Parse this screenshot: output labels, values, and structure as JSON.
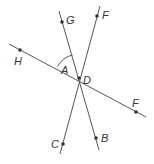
{
  "diagram": {
    "type": "intersecting-lines",
    "intersection_label": "D",
    "angle_label": "A",
    "points": [
      {
        "label": "G",
        "x": 62,
        "y": 22,
        "lx": 66,
        "ly": 24
      },
      {
        "label": "F",
        "x": 97,
        "y": 16,
        "lx": 102,
        "ly": 19
      },
      {
        "label": "H",
        "x": 20,
        "y": 50,
        "lx": 14,
        "ly": 65
      },
      {
        "label": "D",
        "x": 79,
        "y": 78,
        "lx": 83,
        "ly": 83
      },
      {
        "label": "F",
        "x": 136,
        "y": 112,
        "lx": 132,
        "ly": 107
      },
      {
        "label": "C",
        "x": 63,
        "y": 144,
        "lx": 51,
        "ly": 148
      },
      {
        "label": "B",
        "x": 96,
        "y": 138,
        "lx": 101,
        "ly": 142
      }
    ],
    "angle": {
      "label": "A",
      "lx": 61,
      "ly": 74
    },
    "colors": {
      "line": "#555555",
      "point": "#333333",
      "text": "#333333"
    }
  }
}
